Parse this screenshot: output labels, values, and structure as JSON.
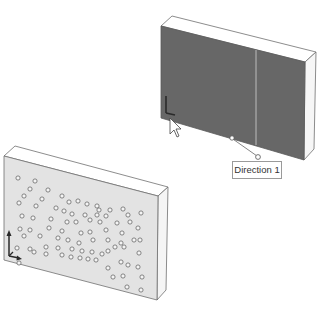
{
  "viewport": {
    "description": "CAD graphics area showing a linear pattern preview on a plate",
    "colors": {
      "background": "#ffffff",
      "selected_face": "#6b6b6b",
      "plate_face": "#e4e4e4",
      "plate_top": "#ffffff",
      "plate_side": "#f4f4f4",
      "edge": "#6a6a6a",
      "hole_stroke": "#6a6a6a",
      "triad": "#2a2a2a"
    }
  },
  "top_model": {
    "name": "plate-with-selected-face",
    "selected_face": true,
    "callout": {
      "label": "Direction 1"
    },
    "cursor": "arrow-with-selection-icon"
  },
  "bottom_model": {
    "name": "plate-with-hole-pattern",
    "hole_pattern_description": "Diamond / rhombus arrangement of small circular holes in concentric rings"
  },
  "triad": {
    "axes": [
      "Y",
      "X"
    ]
  }
}
